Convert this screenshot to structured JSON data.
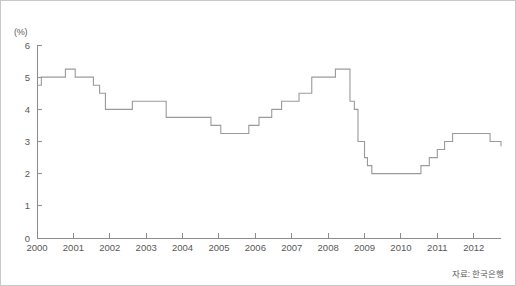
{
  "figure": {
    "unit_label": "(%)",
    "source_note": "자료: 한국은행",
    "line_color": "#9a9a9a",
    "axis_color": "#8c8c8c",
    "text_color": "#575757",
    "border_color": "#c8c8c8",
    "background_color": "#ffffff"
  },
  "chart_data": {
    "type": "line",
    "title": "",
    "subtitle": "",
    "xlabel": "",
    "ylabel": "(%)",
    "unit": "%",
    "source": "자료: 한국은행",
    "grid": false,
    "legend": false,
    "legend_position": "none",
    "step_style": "post",
    "xlim": [
      2000.0,
      2012.75
    ],
    "ylim": [
      0,
      6
    ],
    "ytick_labels": [
      "0",
      "1",
      "2",
      "3",
      "4",
      "5",
      "6"
    ],
    "yticks": [
      0,
      1,
      2,
      3,
      4,
      5,
      6
    ],
    "xtick_labels": [
      "2000",
      "2001",
      "2002",
      "2003",
      "2004",
      "2005",
      "2006",
      "2007",
      "2008",
      "2009",
      "2010",
      "2011",
      "2012"
    ],
    "xticks": [
      2000,
      2001,
      2002,
      2003,
      2004,
      2005,
      2006,
      2007,
      2008,
      2009,
      2010,
      2011,
      2012
    ],
    "series": [
      {
        "name": "기준금리",
        "x": [
          2000.0,
          2000.12,
          2000.78,
          2001.05,
          2001.2,
          2001.55,
          2001.72,
          2001.88,
          2002.25,
          2002.62,
          2003.15,
          2003.55,
          2004.3,
          2004.78,
          2005.05,
          2005.82,
          2006.1,
          2006.45,
          2006.72,
          2007.2,
          2007.55,
          2008.2,
          2008.6,
          2008.72,
          2008.82,
          2008.9,
          2009.0,
          2009.08,
          2009.2,
          2010.55,
          2010.78,
          2011.0,
          2011.2,
          2011.42,
          2012.45,
          2012.75
        ],
        "y": [
          4.75,
          5.0,
          5.25,
          5.0,
          5.0,
          4.75,
          4.5,
          4.0,
          4.0,
          4.25,
          4.25,
          3.75,
          3.75,
          3.5,
          3.25,
          3.5,
          3.75,
          4.0,
          4.25,
          4.5,
          5.0,
          5.25,
          4.25,
          4.0,
          3.0,
          3.0,
          2.5,
          2.25,
          2.0,
          2.25,
          2.5,
          2.75,
          3.0,
          3.25,
          3.0,
          2.85
        ]
      }
    ]
  }
}
